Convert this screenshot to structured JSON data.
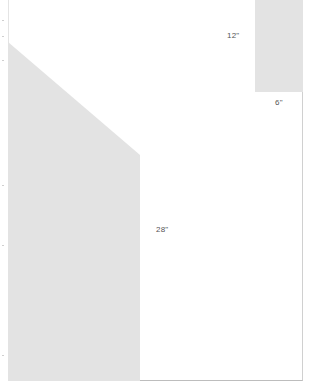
{
  "diagram": {
    "type": "dimensioned-layout",
    "fill_color": "#e3e3e3",
    "background_color": "#ffffff",
    "labels": {
      "top_height": "12\"",
      "top_width": "6\"",
      "main_height": "28\""
    },
    "shapes": [
      {
        "name": "small-rectangle",
        "points": "255,0 303,0 303,92 255,92"
      },
      {
        "name": "main-panel",
        "points": "8,42 140,155 140,381 8,381"
      }
    ]
  }
}
